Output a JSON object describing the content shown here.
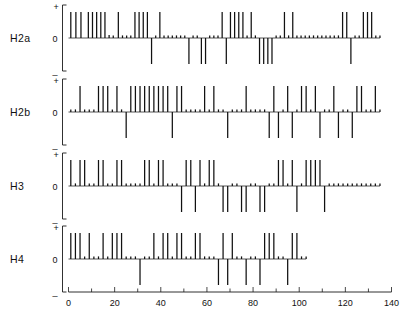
{
  "figure": {
    "background": "#ffffff",
    "ink_color": "#111111"
  },
  "axis": {
    "x_ticks_major": [
      0,
      20,
      40,
      60,
      80,
      100,
      120,
      140
    ],
    "x_tick_labels": [
      "0",
      "20",
      "40",
      "60",
      "80",
      "100",
      "120",
      "140"
    ],
    "x_ticks_minor": [
      10,
      30,
      50,
      70,
      90,
      110,
      130
    ],
    "x_min": 0,
    "x_max": 140,
    "y_symbols": {
      "plus": "+",
      "zero": "0",
      "minus": "_"
    }
  },
  "rows": [
    {
      "label": "H2a"
    },
    {
      "label": "H2b"
    },
    {
      "label": "H3"
    },
    {
      "label": "H4"
    }
  ],
  "chart_data": {
    "type": "bar",
    "xlabel": "",
    "ylabel": "",
    "xlim": [
      0,
      140
    ],
    "ylim": [
      -1,
      1
    ],
    "grid": false,
    "legend": null,
    "series": [
      {
        "name": "H2a",
        "x": [
          1.0,
          3.2,
          5.4,
          8.6,
          10.4,
          12.2,
          14.0,
          15.8,
          17.6,
          19.4,
          21.6,
          23.4,
          25.2,
          27.0,
          28.8,
          30.6,
          32.4,
          34.2,
          36.0,
          37.8,
          39.6,
          41.4,
          43.2,
          45.0,
          46.8,
          48.6,
          50.4,
          52.2,
          54.0,
          55.8,
          57.6,
          59.4,
          61.2,
          63.0,
          64.8,
          66.6,
          68.4,
          70.2,
          72.0,
          73.8,
          75.6,
          77.4,
          79.2,
          81.0,
          82.8,
          84.6,
          86.4,
          88.2,
          90.0,
          91.8,
          93.6,
          95.4,
          97.2,
          99.0,
          100.8,
          102.6,
          104.4,
          106.2,
          108.0,
          109.8,
          111.6,
          113.4,
          115.2,
          117.0,
          118.8,
          120.6,
          122.4,
          124.2,
          126.0,
          127.8,
          129.6,
          131.4,
          133.2,
          135.0
        ],
        "values": [
          1.0,
          1.0,
          1.0,
          1.0,
          1.0,
          1.0,
          1.0,
          1.0,
          0.12,
          0.1,
          1.0,
          0.1,
          0.1,
          0.1,
          1.0,
          1.0,
          1.0,
          1.0,
          -1.0,
          0.1,
          1.0,
          0.1,
          0.1,
          0.1,
          0.1,
          0.1,
          0.1,
          -1.0,
          0.1,
          0.1,
          -1.0,
          -1.0,
          0.1,
          0.1,
          0.1,
          1.0,
          -1.0,
          1.0,
          1.0,
          1.0,
          1.0,
          0.1,
          1.0,
          0.1,
          -1.0,
          -1.0,
          -1.0,
          -1.0,
          0.1,
          0.1,
          1.0,
          0.1,
          1.0,
          0.1,
          0.1,
          0.1,
          0.1,
          0.1,
          0.1,
          0.1,
          0.1,
          0.1,
          0.1,
          0.1,
          1.0,
          1.0,
          -1.0,
          0.1,
          0.1,
          1.0,
          1.0,
          1.0,
          0.1,
          0.1
        ]
      },
      {
        "name": "H2b",
        "x": [
          1.0,
          3.0,
          5.0,
          7.0,
          9.0,
          11.0,
          13.0,
          15.0,
          17.0,
          19.0,
          21.0,
          23.0,
          25.0,
          27.0,
          29.0,
          31.0,
          33.0,
          35.0,
          37.0,
          39.0,
          41.0,
          43.0,
          45.0,
          47.0,
          49.0,
          51.0,
          53.0,
          55.0,
          57.0,
          59.0,
          61.0,
          63.0,
          65.0,
          67.0,
          69.0,
          71.0,
          73.0,
          75.0,
          77.0,
          79.0,
          81.0,
          83.0,
          85.0,
          87.0,
          89.0,
          91.0,
          93.0,
          95.0,
          97.0,
          99.0,
          101.0,
          103.0,
          105.0,
          107.0,
          109.0,
          111.0,
          113.0,
          115.0,
          117.0,
          119.0,
          121.0,
          123.0,
          125.0,
          127.0,
          129.0,
          131.0,
          133.0,
          135.0
        ],
        "values": [
          0.1,
          0.1,
          1.0,
          0.1,
          0.1,
          0.1,
          1.0,
          1.0,
          1.0,
          0.1,
          1.0,
          0.1,
          -1.0,
          1.0,
          1.0,
          1.0,
          1.0,
          1.0,
          1.0,
          1.0,
          1.0,
          1.0,
          -1.0,
          1.0,
          1.0,
          0.1,
          0.1,
          0.1,
          0.1,
          1.0,
          0.1,
          1.0,
          0.1,
          0.1,
          -1.0,
          0.1,
          0.1,
          0.1,
          1.0,
          0.1,
          0.1,
          0.1,
          0.1,
          -1.0,
          1.0,
          -1.0,
          0.1,
          1.0,
          -1.0,
          0.1,
          1.0,
          1.0,
          0.1,
          1.0,
          -1.0,
          0.1,
          0.1,
          1.0,
          -1.0,
          0.1,
          0.1,
          -1.0,
          1.0,
          1.0,
          0.1,
          0.1,
          1.0,
          0.1
        ]
      },
      {
        "name": "H3",
        "x": [
          1.0,
          3.0,
          5.0,
          7.0,
          9.0,
          11.0,
          13.0,
          15.0,
          17.0,
          19.0,
          21.0,
          23.0,
          25.0,
          27.0,
          29.0,
          31.0,
          33.0,
          35.0,
          37.0,
          39.0,
          41.0,
          43.0,
          45.0,
          47.0,
          49.0,
          51.0,
          53.0,
          55.0,
          57.0,
          59.0,
          61.0,
          63.0,
          65.0,
          67.0,
          69.0,
          71.0,
          73.0,
          75.0,
          77.0,
          79.0,
          81.0,
          83.0,
          85.0,
          87.0,
          89.0,
          91.0,
          93.0,
          95.0,
          97.0,
          99.0,
          101.0,
          103.0,
          105.0,
          107.0,
          109.0,
          111.0,
          113.0,
          115.0,
          117.0,
          119.0,
          121.0,
          123.0,
          125.0,
          127.0,
          129.0,
          131.0,
          133.0,
          135.0
        ],
        "values": [
          1.0,
          0.1,
          1.0,
          1.0,
          0.1,
          0.1,
          1.0,
          1.0,
          0.1,
          0.1,
          1.0,
          1.0,
          0.1,
          0.1,
          0.1,
          0.1,
          1.0,
          1.0,
          0.1,
          1.0,
          1.0,
          0.1,
          0.1,
          0.1,
          -1.0,
          1.0,
          1.0,
          -1.0,
          1.0,
          0.1,
          1.0,
          1.0,
          0.1,
          -1.0,
          -1.0,
          0.1,
          0.1,
          -1.0,
          -1.0,
          0.1,
          0.1,
          -1.0,
          -1.0,
          0.1,
          0.1,
          1.0,
          1.0,
          0.1,
          1.0,
          -1.0,
          0.1,
          1.0,
          1.0,
          1.0,
          1.0,
          -1.0,
          0.1,
          0.1,
          0.1,
          0.1,
          0.1,
          0.1,
          0.1,
          0.1,
          0.1,
          0.1,
          0.1,
          0.1
        ]
      },
      {
        "name": "H4",
        "x": [
          1.0,
          3.0,
          5.0,
          7.0,
          9.0,
          11.0,
          13.0,
          15.0,
          17.0,
          19.0,
          21.0,
          23.0,
          25.0,
          27.0,
          29.0,
          31.0,
          33.0,
          35.0,
          37.0,
          39.0,
          41.0,
          43.0,
          45.0,
          47.0,
          49.0,
          51.0,
          53.0,
          55.0,
          57.0,
          59.0,
          61.0,
          63.0,
          65.0,
          67.0,
          69.0,
          71.0,
          73.0,
          75.0,
          77.0,
          79.0,
          81.0,
          83.0,
          85.0,
          87.0,
          89.0,
          91.0,
          93.0,
          95.0,
          97.0,
          99.0,
          101.0,
          103.0
        ],
        "values": [
          1.0,
          1.0,
          1.0,
          0.1,
          1.0,
          0.1,
          0.1,
          1.0,
          0.1,
          1.0,
          1.0,
          1.0,
          0.1,
          0.1,
          0.1,
          -1.0,
          0.1,
          0.1,
          1.0,
          0.1,
          1.0,
          1.0,
          0.1,
          1.0,
          1.0,
          0.1,
          0.1,
          1.0,
          1.0,
          0.1,
          0.1,
          0.1,
          -1.0,
          1.0,
          -1.0,
          1.0,
          0.1,
          0.1,
          -1.0,
          0.1,
          0.1,
          -1.0,
          1.0,
          1.0,
          1.0,
          0.1,
          0.1,
          -1.0,
          1.0,
          1.0,
          0.1,
          0.1
        ]
      }
    ]
  }
}
